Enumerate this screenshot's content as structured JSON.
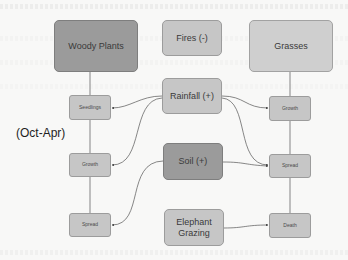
{
  "diagram": {
    "title": "",
    "season_label": "(Oct-Apr)",
    "columns": {
      "woody": {
        "header": "Woody Plants",
        "stages": [
          "Seedlings",
          "Growth",
          "Spread"
        ]
      },
      "grasses": {
        "header": "Grasses",
        "stages": [
          "Growth",
          "Spread",
          "Death"
        ]
      }
    },
    "factors": [
      {
        "id": "fires",
        "label": "Fires (-)"
      },
      {
        "id": "rainfall",
        "label": "Rainfall (+)"
      },
      {
        "id": "soil",
        "label": "Soil (+)"
      },
      {
        "id": "elephant",
        "label": "Elephant Grazing"
      }
    ],
    "edges": [
      {
        "from": "Woody Plants",
        "to": "Seedlings"
      },
      {
        "from": "Seedlings",
        "to": "Growth (woody)"
      },
      {
        "from": "Growth (woody)",
        "to": "Spread (woody)"
      },
      {
        "from": "Grasses",
        "to": "Growth (grasses)"
      },
      {
        "from": "Growth (grasses)",
        "to": "Spread (grasses)"
      },
      {
        "from": "Spread (grasses)",
        "to": "Death"
      },
      {
        "from": "Rainfall (+)",
        "to": "Seedlings"
      },
      {
        "from": "Rainfall (+)",
        "to": "Growth (woody)"
      },
      {
        "from": "Rainfall (+)",
        "to": "Growth (grasses)"
      },
      {
        "from": "Rainfall (+)",
        "to": "Spread (grasses)"
      },
      {
        "from": "Soil (+)",
        "to": "Spread (woody)"
      },
      {
        "from": "Soil (+)",
        "to": "Spread (grasses)"
      },
      {
        "from": "Elephant Grazing",
        "to": "Death"
      }
    ],
    "colors": {
      "background": "#f8f8f7",
      "dark_node": "#9b9b9b",
      "light_node": "#c6c6c6",
      "edge": "#555555"
    }
  }
}
